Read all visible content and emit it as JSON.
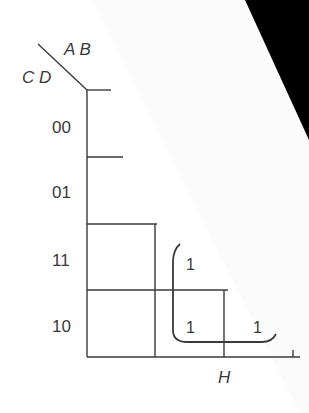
{
  "kmap": {
    "col_var_label": "A B",
    "row_var_label": "C D",
    "row_labels": [
      "00",
      "01",
      "11",
      "10"
    ],
    "cells": [
      {
        "row": "11",
        "col_index": 1,
        "value": "1"
      },
      {
        "row": "10",
        "col_index": 1,
        "value": "1"
      },
      {
        "row": "10",
        "col_index": 2,
        "value": "1"
      }
    ],
    "bottom_label": "H",
    "line_color": "#3a3a3a",
    "occluder_color": "#000000"
  }
}
